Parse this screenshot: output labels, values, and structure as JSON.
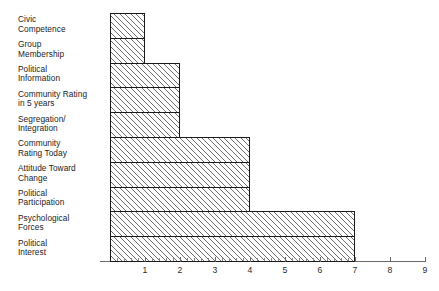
{
  "chart_data": {
    "type": "bar",
    "orientation": "horizontal",
    "title": "",
    "subtitle": "",
    "xlabel": "",
    "ylabel": "",
    "xlim": [
      0,
      9
    ],
    "grid": false,
    "legend": null,
    "bar_style": {
      "fill": "#ffffff",
      "hatch": "/",
      "hatch_color": "#6e6e6e",
      "edge_color": "#1a1a1a"
    },
    "xticks": [
      1,
      2,
      3,
      4,
      5,
      6,
      7,
      8,
      9
    ],
    "xtick_labels": [
      "1",
      "2",
      "3",
      "4",
      "5",
      "6",
      "7",
      "8",
      "9"
    ],
    "minor_ticks_end": 7,
    "minor_tick_step": 0.2,
    "categories": [
      "Civic\nCompetence",
      "Group\nMembership",
      "Political\nInformation",
      "Community Rating\nin 5 years",
      "Segregation/\nIntegration",
      "Community\nRating Today",
      "Attitude Toward\nChange",
      "Political\nParticipation",
      "Psychological\nForces",
      "Political\nInterest"
    ],
    "values": [
      1,
      1,
      2,
      2,
      2,
      4,
      4,
      4,
      7,
      7
    ]
  }
}
